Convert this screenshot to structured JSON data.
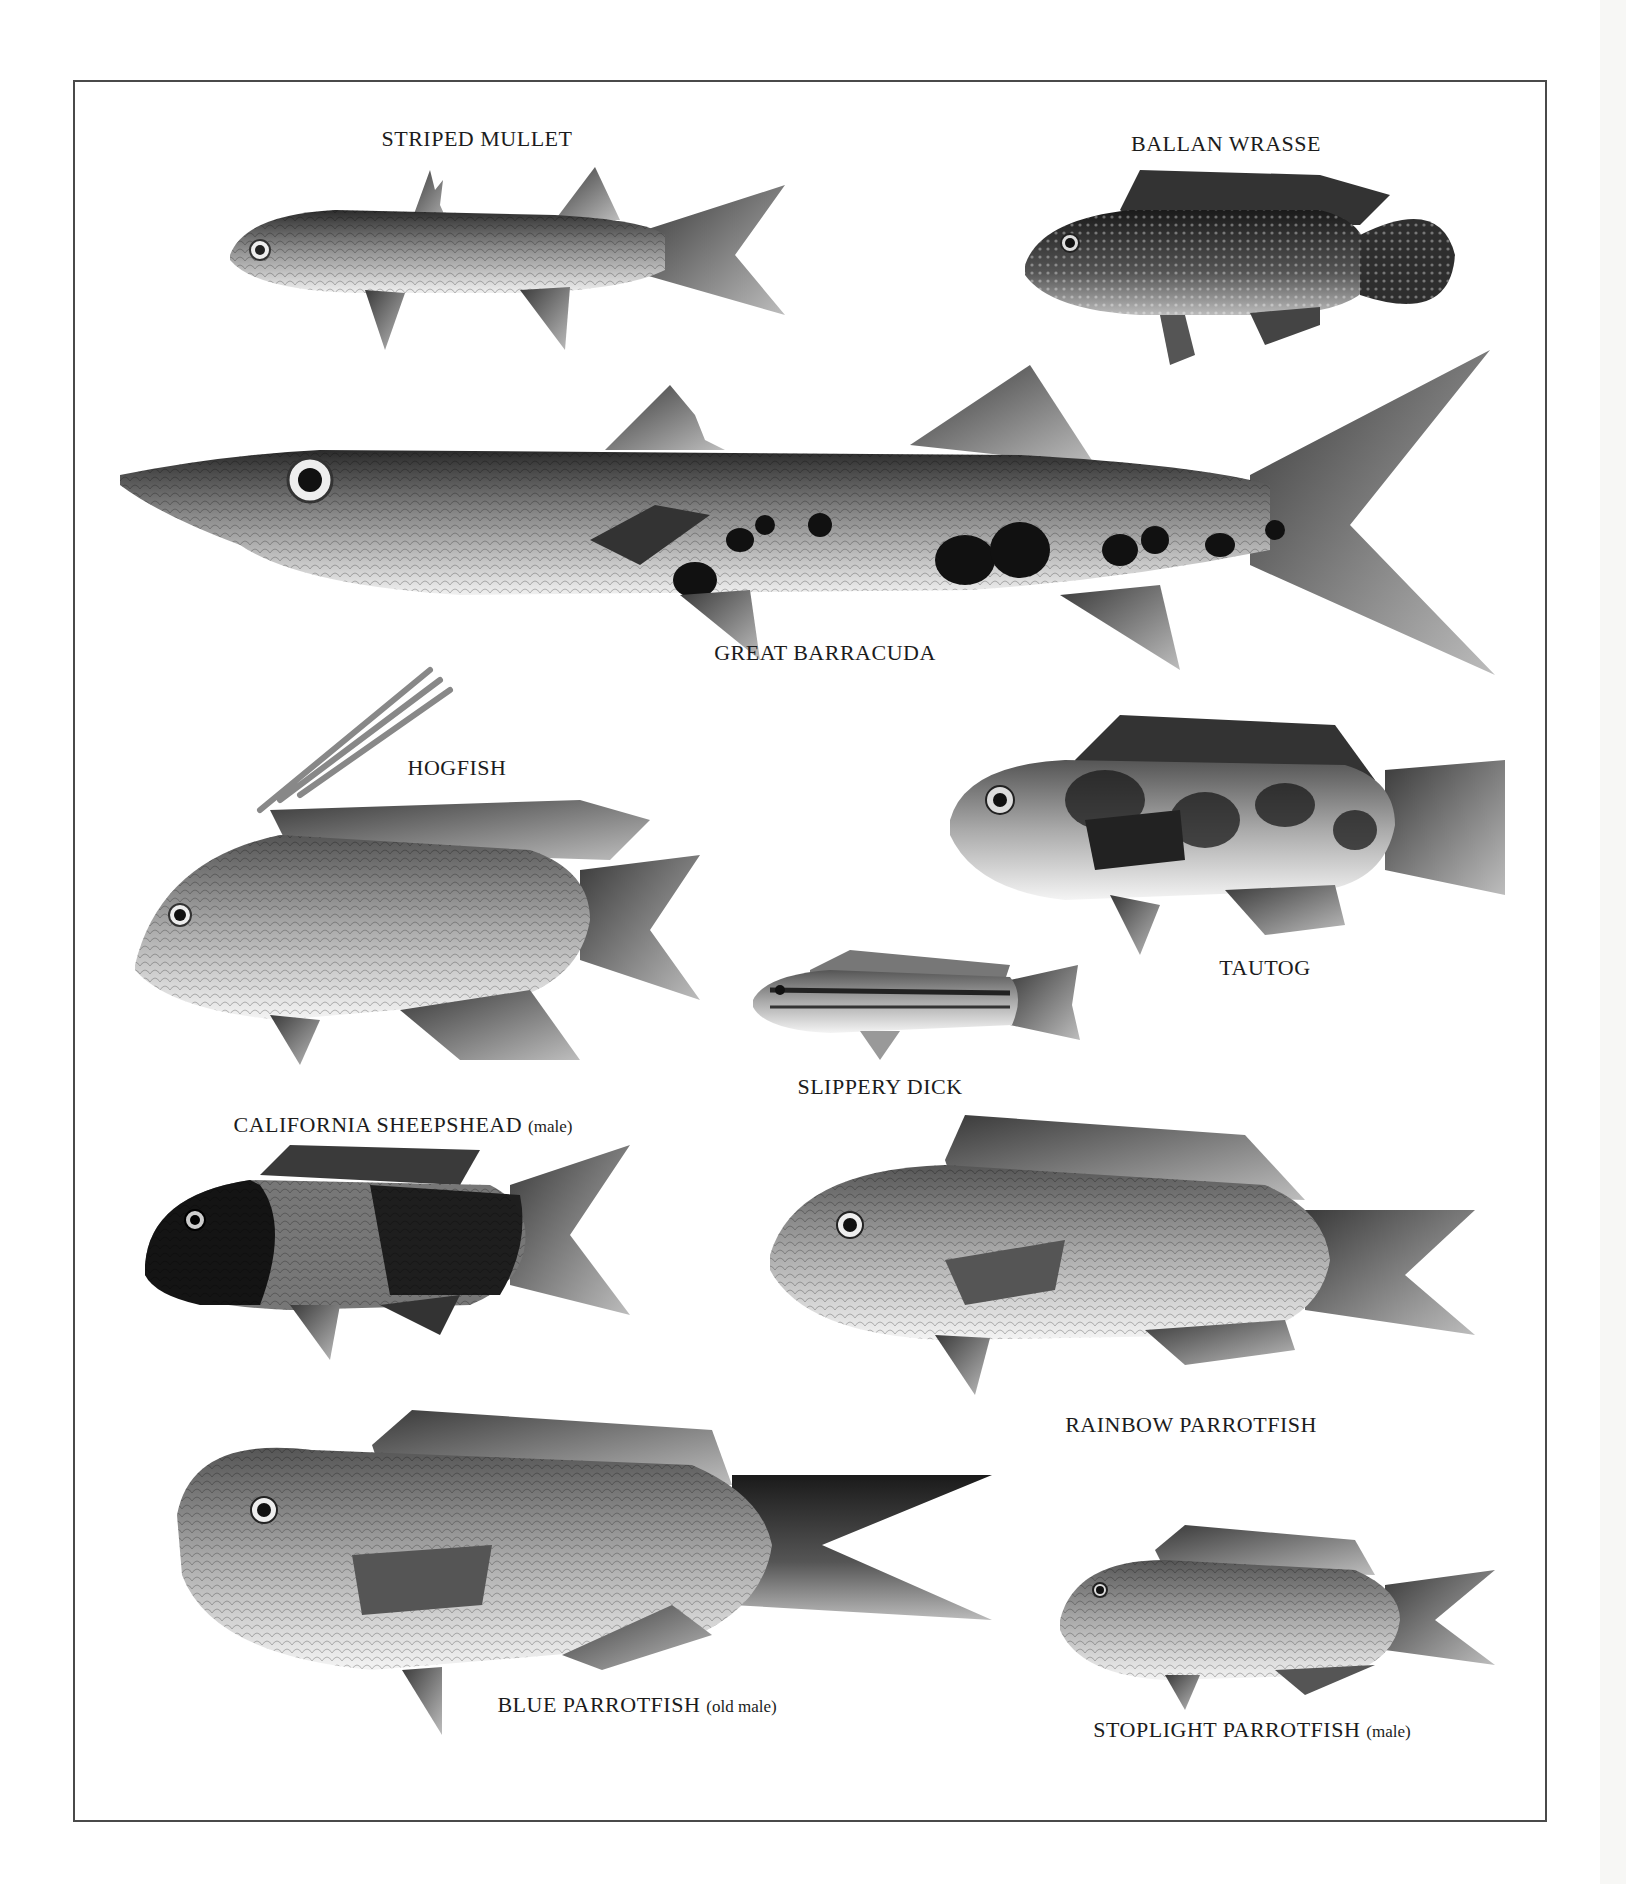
{
  "page": {
    "type": "illustrated plate",
    "frame_border_color": "#4a4a4a",
    "background": "#ffffff"
  },
  "species": [
    {
      "id": "striped-mullet",
      "name": "STRIPED MULLET",
      "note": ""
    },
    {
      "id": "ballan-wrasse",
      "name": "BALLAN WRASSE",
      "note": ""
    },
    {
      "id": "great-barracuda",
      "name": "GREAT BARRACUDA",
      "note": ""
    },
    {
      "id": "hogfish",
      "name": "HOGFISH",
      "note": ""
    },
    {
      "id": "tautog",
      "name": "TAUTOG",
      "note": ""
    },
    {
      "id": "slippery-dick",
      "name": "SLIPPERY DICK",
      "note": ""
    },
    {
      "id": "california-sheepshead",
      "name": "CALIFORNIA SHEEPSHEAD",
      "note": "(male)"
    },
    {
      "id": "rainbow-parrotfish",
      "name": "RAINBOW PARROTFISH",
      "note": ""
    },
    {
      "id": "blue-parrotfish",
      "name": "BLUE PARROTFISH",
      "note": "(old male)"
    },
    {
      "id": "stoplight-parrotfish",
      "name": "STOPLIGHT PARROTFISH",
      "note": "(male)"
    }
  ]
}
